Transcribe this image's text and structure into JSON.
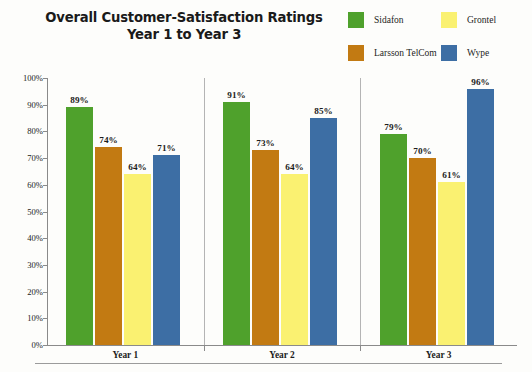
{
  "chart_data": {
    "type": "bar",
    "title": "Overall Customer-Satisfaction Ratings Year 1 to Year 3",
    "title_line1": "Overall Customer-Satisfaction Ratings",
    "title_line2": "Year 1 to Year 3",
    "xlabel": "",
    "ylabel": "",
    "ylim": [
      0,
      100
    ],
    "grid": false,
    "legend_position": "top-right",
    "categories": [
      "Year 1",
      "Year 2",
      "Year 3"
    ],
    "y_ticks": [
      "0%",
      "10%",
      "20%",
      "30%",
      "40%",
      "50%",
      "60%",
      "70%",
      "80%",
      "90%",
      "100%"
    ],
    "y_tick_values": [
      0,
      10,
      20,
      30,
      40,
      50,
      60,
      70,
      80,
      90,
      100
    ],
    "series": [
      {
        "name": "Sidafon",
        "color": "#4FA12C",
        "values": [
          89,
          91,
          79
        ],
        "labels": [
          "89%",
          "91%",
          "79%"
        ]
      },
      {
        "name": "Larsson TelCom",
        "color": "#C27A12",
        "values": [
          74,
          73,
          70
        ],
        "labels": [
          "74%",
          "73%",
          "70%"
        ]
      },
      {
        "name": "Grontel",
        "color": "#FAF171",
        "values": [
          64,
          64,
          61
        ],
        "labels": [
          "64%",
          "64%",
          "61%"
        ]
      },
      {
        "name": "Wype",
        "color": "#3D6EA4",
        "values": [
          71,
          85,
          96
        ],
        "labels": [
          "71%",
          "85%",
          "96%"
        ]
      }
    ]
  },
  "legend": {
    "items": [
      {
        "label": "Sidafon",
        "color": "#4FA12C"
      },
      {
        "label": "Grontel",
        "color": "#FAF171"
      },
      {
        "label": "Larsson TelCom",
        "color": "#C27A12"
      },
      {
        "label": "Wype",
        "color": "#3D6EA4"
      }
    ]
  }
}
